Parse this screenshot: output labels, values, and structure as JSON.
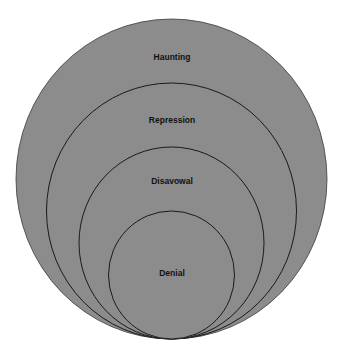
{
  "diagram": {
    "type": "nested-circles",
    "fill_color": "#8c8c8c",
    "stroke_color": "#1a1a1a",
    "levels": [
      {
        "label": "Haunting",
        "cx": 171.5,
        "rx": 155.5,
        "ry": 160,
        "label_y": 60
      },
      {
        "label": "Repression",
        "cx": 171.5,
        "rx": 125,
        "ry": 128,
        "label_y": 123
      },
      {
        "label": "Disavowal",
        "cx": 171.5,
        "rx": 92.5,
        "ry": 96,
        "label_y": 184
      },
      {
        "label": "Denial",
        "cx": 171.5,
        "rx": 63,
        "ry": 64,
        "label_y": 276
      }
    ],
    "tangent_bottom_y": 339
  }
}
